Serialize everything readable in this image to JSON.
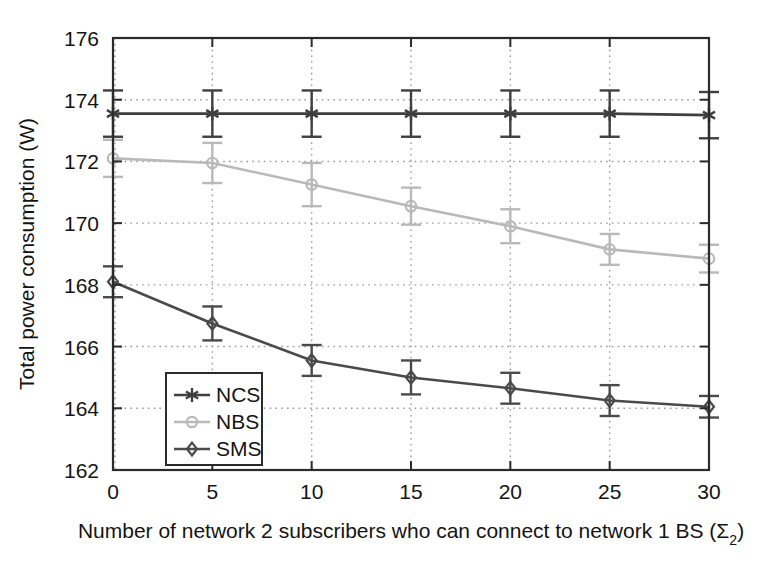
{
  "chart_data": {
    "type": "line",
    "title": "",
    "xlabel": "Number of network 2 subscribers who can connect to network 1 BS (Σ₂)",
    "xlabel_main": "Number of network 2 subscribers who can connect to network 1 BS (Σ",
    "xlabel_sub": "2",
    "xlabel_tail": ")",
    "ylabel": "Total power consumption (W)",
    "x": [
      0,
      5,
      10,
      15,
      20,
      25,
      30
    ],
    "xticklabels": [
      "0",
      "5",
      "10",
      "15",
      "20",
      "25",
      "30"
    ],
    "yticklabels": [
      "162",
      "164",
      "166",
      "168",
      "170",
      "172",
      "174",
      "176"
    ],
    "yticks": [
      162,
      164,
      166,
      168,
      170,
      172,
      174,
      176
    ],
    "xlim": [
      0,
      30
    ],
    "ylim": [
      162,
      176
    ],
    "grid": true,
    "grid_style": "dotted",
    "legend_position": "lower left",
    "series": [
      {
        "name": "NCS",
        "marker": "asterisk",
        "color": "#3f3f3f",
        "values": [
          173.55,
          173.55,
          173.55,
          173.55,
          173.55,
          173.55,
          173.5
        ],
        "errors": [
          0.75,
          0.75,
          0.75,
          0.75,
          0.75,
          0.75,
          0.75
        ]
      },
      {
        "name": "NBS",
        "marker": "circle",
        "color": "#b9b9b9",
        "values": [
          172.1,
          171.95,
          171.25,
          170.55,
          169.9,
          169.15,
          168.85
        ],
        "errors": [
          0.6,
          0.65,
          0.7,
          0.6,
          0.55,
          0.5,
          0.45
        ]
      },
      {
        "name": "SMS",
        "marker": "diamond",
        "color": "#4a4a4a",
        "values": [
          168.1,
          166.75,
          165.55,
          165.0,
          164.65,
          164.25,
          164.05
        ],
        "errors": [
          0.5,
          0.55,
          0.5,
          0.55,
          0.5,
          0.5,
          0.35
        ]
      }
    ]
  },
  "legend": {
    "entries": [
      {
        "label": "NCS"
      },
      {
        "label": "NBS"
      },
      {
        "label": "SMS"
      }
    ]
  },
  "colors": {
    "axis": "#2b2b2b",
    "grid": "#9a9a9a",
    "background": "#ffffff",
    "ncs": "#3f3f3f",
    "nbs": "#b9b9b9",
    "sms": "#4a4a4a"
  }
}
